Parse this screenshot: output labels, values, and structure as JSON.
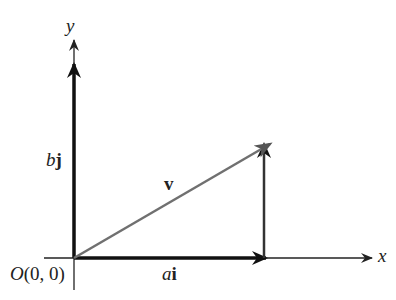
{
  "diagram": {
    "type": "vector-decomposition",
    "axes": {
      "x_label": "x",
      "y_label": "y"
    },
    "origin_label": {
      "italic": "O",
      "rest": "(0, 0)"
    },
    "vectors": [
      {
        "name": "ai",
        "scalar": "a",
        "unit": "i",
        "from": [
          0,
          0
        ],
        "to": [
          "a",
          0
        ],
        "color": "#111111"
      },
      {
        "name": "bj",
        "scalar": "b",
        "unit": "j",
        "from": [
          0,
          0
        ],
        "to": [
          0,
          "b"
        ],
        "color": "#111111"
      },
      {
        "name": "v",
        "label": "v",
        "from": [
          0,
          0
        ],
        "to": [
          "a",
          "b"
        ],
        "color": "#707070"
      }
    ],
    "colors": {
      "axis": "#222222",
      "component": "#111111",
      "resultant": "#707070",
      "projection": "#333333"
    }
  }
}
